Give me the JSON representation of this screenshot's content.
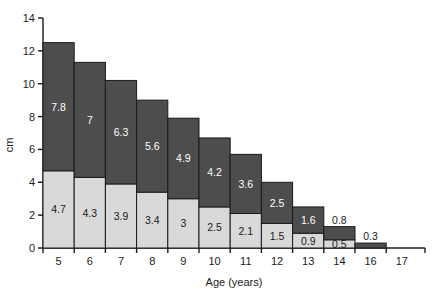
{
  "chart_data": {
    "type": "bar",
    "stacked": true,
    "title": "",
    "subtitle": "",
    "xlabel": "Age (years)",
    "ylabel": "cm",
    "categories": [
      "5",
      "6",
      "7",
      "8",
      "9",
      "10",
      "11",
      "12",
      "13",
      "14",
      "16",
      "17"
    ],
    "xtick_labels": [
      "5",
      "6",
      "7",
      "8",
      "9",
      "10",
      "11",
      "12",
      "13",
      "14",
      "16",
      "17"
    ],
    "ytick_labels": [
      "0",
      "2",
      "4",
      "6",
      "8",
      "10",
      "12",
      "14"
    ],
    "ytick_values": [
      0,
      2,
      4,
      6,
      8,
      10,
      12,
      14
    ],
    "ylim": [
      0,
      14
    ],
    "grid": false,
    "legend": "none",
    "series": [
      {
        "name": "lower-segment",
        "color": "#d9d9d9",
        "label_color": "#1a1a1a",
        "values": [
          4.7,
          4.3,
          3.9,
          3.4,
          3,
          2.5,
          2.1,
          1.5,
          0.9,
          0.5,
          0,
          0
        ],
        "labels": [
          "4.7",
          "4.3",
          "3.9",
          "3.4",
          "3",
          "2.5",
          "2.1",
          "1.5",
          "0.9",
          "0.5",
          "",
          ""
        ]
      },
      {
        "name": "upper-segment",
        "color": "#4d4d4d",
        "label_color": "#ffffff",
        "values": [
          7.8,
          7,
          6.3,
          5.6,
          4.9,
          4.2,
          3.6,
          2.5,
          1.6,
          0.8,
          0.3,
          0
        ],
        "labels": [
          "7.8",
          "7",
          "6.3",
          "5.6",
          "4.9",
          "4.2",
          "3.6",
          "2.5",
          "1.6",
          "0.8",
          "0.3",
          ""
        ]
      }
    ],
    "totals": [
      12.5,
      11.3,
      10.2,
      9.0,
      7.9,
      6.7,
      5.7,
      4.0,
      2.5,
      1.3,
      0.3,
      0
    ],
    "colors": {
      "lower": "#d9d9d9",
      "upper": "#4d4d4d",
      "axis": "#1a1a1a",
      "background": "#ffffff"
    }
  }
}
